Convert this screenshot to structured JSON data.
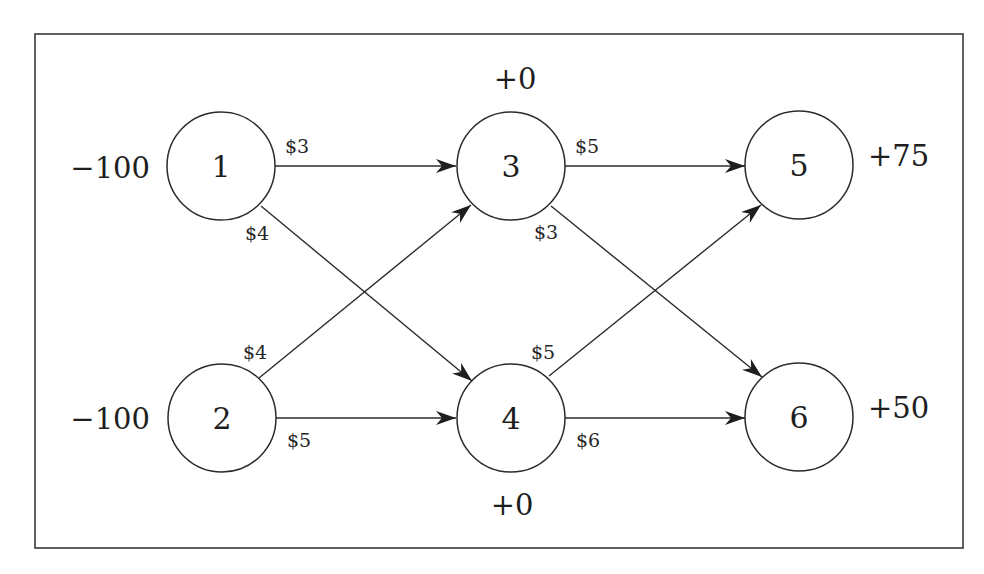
{
  "diagram": {
    "type": "transshipment-network",
    "colors": {
      "stroke": "#2b2b2b",
      "text": "#1e1e1e",
      "background": "#ffffff"
    },
    "nodes": [
      {
        "id": "1",
        "label": "1",
        "supply_label": "−100"
      },
      {
        "id": "2",
        "label": "2",
        "supply_label": "−100"
      },
      {
        "id": "3",
        "label": "3",
        "supply_label": "+0"
      },
      {
        "id": "4",
        "label": "4",
        "supply_label": "+0"
      },
      {
        "id": "5",
        "label": "5",
        "supply_label": "+75"
      },
      {
        "id": "6",
        "label": "6",
        "supply_label": "+50"
      }
    ],
    "edges": [
      {
        "from": "1",
        "to": "3",
        "cost_label": "$3"
      },
      {
        "from": "1",
        "to": "4",
        "cost_label": "$4"
      },
      {
        "from": "2",
        "to": "3",
        "cost_label": "$4"
      },
      {
        "from": "2",
        "to": "4",
        "cost_label": "$5"
      },
      {
        "from": "3",
        "to": "5",
        "cost_label": "$5"
      },
      {
        "from": "3",
        "to": "6",
        "cost_label": "$3"
      },
      {
        "from": "4",
        "to": "5",
        "cost_label": "$5"
      },
      {
        "from": "4",
        "to": "6",
        "cost_label": "$6"
      }
    ]
  }
}
